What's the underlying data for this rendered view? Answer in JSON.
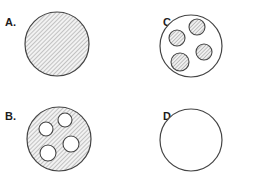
{
  "sheet": {
    "width": 258,
    "height": 188,
    "background_color": "#ffffff",
    "description": "Four labeled circle diagrams arranged in a two-by-two grid"
  },
  "style": {
    "outline_color": "#444444",
    "hatch_line_color": "#8a8a8a",
    "hatch_background_color": "#f2f2f2",
    "inner_circle_fill_color": "#ffffff",
    "label_color": "#1c1c1c"
  },
  "panels": [
    {
      "id": "a",
      "label": "A.",
      "outer_circle": {
        "cx": 57,
        "cy": 44,
        "r": 32,
        "fill": "hatched",
        "stroke": "#444444"
      },
      "inner_circles": []
    },
    {
      "id": "b",
      "label": "B.",
      "outer_circle": {
        "cx": 59,
        "cy": 45,
        "r": 32,
        "fill": "hatched",
        "stroke": "#444444"
      },
      "inner_circles": [
        {
          "cx": 46,
          "cy": 35,
          "r": 7,
          "fill": "white"
        },
        {
          "cx": 65,
          "cy": 26,
          "r": 7,
          "fill": "white"
        },
        {
          "cx": 71,
          "cy": 50,
          "r": 8,
          "fill": "white"
        },
        {
          "cx": 48,
          "cy": 59,
          "r": 8,
          "fill": "white"
        }
      ]
    },
    {
      "id": "c",
      "label": "C.",
      "outer_circle": {
        "cx": 62,
        "cy": 46,
        "r": 31,
        "fill": "white",
        "stroke": "#444444"
      },
      "inner_circles": [
        {
          "cx": 48,
          "cy": 38,
          "r": 8,
          "fill": "hatched"
        },
        {
          "cx": 68,
          "cy": 27,
          "r": 8,
          "fill": "hatched"
        },
        {
          "cx": 75,
          "cy": 52,
          "r": 8,
          "fill": "hatched"
        },
        {
          "cx": 51,
          "cy": 62,
          "r": 9,
          "fill": "hatched"
        }
      ]
    },
    {
      "id": "d",
      "label": "D.",
      "outer_circle": {
        "cx": 62,
        "cy": 46,
        "r": 31,
        "fill": "white",
        "stroke": "#444444"
      },
      "inner_circles": []
    }
  ]
}
